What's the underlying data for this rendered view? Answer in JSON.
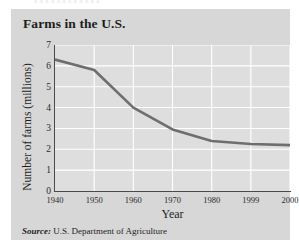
{
  "page": {
    "clipped_top_text": "a a a a a a a a a a a a"
  },
  "figure": {
    "title": "Farms in the U.S.",
    "source_label": "Source:",
    "source_text": "U.S. Department of Agriculture",
    "panel_color": "#d7d7d7",
    "plot_color": "#dedede",
    "gridline_color": "#ffffff",
    "axis_color": "#4a4a4a",
    "line_color": "#6e6e6e"
  },
  "chart_data": {
    "type": "line",
    "title": "Farms in the U.S.",
    "xlabel": "Year",
    "ylabel": "Number of farms (millions)",
    "x_tick_labels": [
      "1940",
      "1950",
      "1960",
      "1970",
      "1980",
      "1999",
      "2000"
    ],
    "y_tick_labels": [
      "0",
      "1",
      "2",
      "3",
      "4",
      "5",
      "6",
      "7"
    ],
    "ylim": [
      0,
      7
    ],
    "grid": true,
    "legend": "none",
    "series": [
      {
        "name": "Number of farms (millions)",
        "x": [
          "1940",
          "1950",
          "1960",
          "1970",
          "1980",
          "1999",
          "2000"
        ],
        "values": [
          6.3,
          5.8,
          4.0,
          2.95,
          2.4,
          2.25,
          2.2
        ]
      }
    ]
  }
}
